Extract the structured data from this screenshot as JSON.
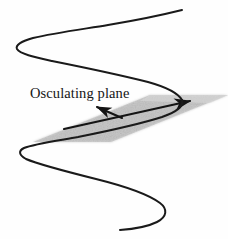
{
  "figure": {
    "background_color": "#fefefe",
    "width": 228,
    "height": 239
  },
  "labels": {
    "osculating_plane": "Osculating plane"
  },
  "chart_data": {
    "type": "diagram",
    "title": "Osculating plane",
    "elements": [
      {
        "name": "space-curve",
        "kind": "curve",
        "stroke": "#1a1a1a",
        "stroke_width": 2.0,
        "points": [
          [
            182,
            10
          ],
          [
            120,
            24
          ],
          [
            70,
            32
          ],
          [
            30,
            40
          ],
          [
            18,
            46
          ],
          [
            22,
            52
          ],
          [
            45,
            60
          ],
          [
            100,
            73
          ],
          [
            150,
            83
          ],
          [
            175,
            92
          ],
          [
            182,
            100
          ],
          [
            176,
            108
          ],
          [
            150,
            117
          ],
          [
            95,
            130
          ],
          [
            50,
            140
          ],
          [
            24,
            146
          ],
          [
            19,
            151
          ],
          [
            25,
            158
          ],
          [
            60,
            168
          ],
          [
            110,
            180
          ],
          [
            150,
            192
          ],
          [
            168,
            203
          ],
          [
            168,
            214
          ],
          [
            150,
            223
          ],
          [
            120,
            229
          ]
        ]
      },
      {
        "name": "osculating-plane-parallelogram",
        "kind": "polygon",
        "fill": "#c9c9c9",
        "opacity": 0.85,
        "vertices": [
          [
            33,
            142
          ],
          [
            150,
            95
          ],
          [
            228,
            95
          ],
          [
            111,
            142
          ]
        ]
      },
      {
        "name": "tangent-vector-arrow",
        "kind": "arrow",
        "stroke": "#141414",
        "stroke_width": 2.1,
        "from": [
          64,
          129
        ],
        "to": [
          190,
          101
        ],
        "arrowhead_at": "to",
        "label": ""
      },
      {
        "name": "normal-vector-arrow",
        "kind": "arrow",
        "stroke": "#141414",
        "stroke_width": 2.0,
        "from": [
          122,
          118
        ],
        "to": [
          97,
          107
        ],
        "arrowhead_at": "to",
        "label": ""
      }
    ],
    "annotations": [
      {
        "name": "osculating-plane-label",
        "text": "Osculating plane",
        "x": 30,
        "y": 85,
        "font_size": 14.5,
        "color": "#151515"
      }
    ],
    "colors": {
      "curve": "#1a1a1a",
      "plane_fill": "#c9c9c9",
      "arrow": "#141414",
      "text": "#151515",
      "background": "#fefefe"
    }
  }
}
